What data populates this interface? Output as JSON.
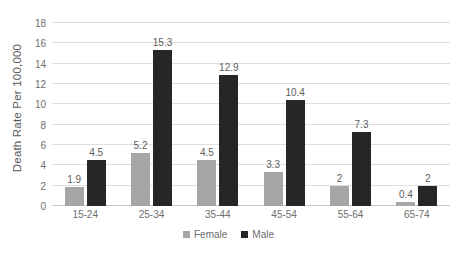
{
  "chart_data": {
    "type": "bar",
    "title": "",
    "xlabel": "",
    "ylabel": "Death Rate Per 100,000",
    "categories": [
      "15-24",
      "25-34",
      "35-44",
      "45-54",
      "55-64",
      "65-74"
    ],
    "series": [
      {
        "name": "Female",
        "color": "#a6a6a6",
        "values": [
          1.9,
          5.2,
          4.5,
          3.3,
          2,
          0.4
        ],
        "labels": [
          "1.9",
          "5.2",
          "4.5",
          "3.3",
          "2",
          "0.4"
        ]
      },
      {
        "name": "Male",
        "color": "#262626",
        "values": [
          4.5,
          15.3,
          12.9,
          10.4,
          7.3,
          2
        ],
        "labels": [
          "4.5",
          "15.3",
          "12.9",
          "10.4",
          "7.3",
          "2"
        ]
      }
    ],
    "ylim": [
      0,
      18
    ],
    "yticks": [
      0,
      2,
      4,
      6,
      8,
      10,
      12,
      14,
      16,
      18
    ],
    "ytick_labels": [
      "0",
      "2",
      "4",
      "6",
      "8",
      "10",
      "12",
      "14",
      "16",
      "18"
    ],
    "grid": true,
    "legend_position": "bottom"
  },
  "colors": {
    "female": "#a6a6a6",
    "male": "#262626",
    "gridline": "#dedede",
    "text": "#6e6e6e",
    "background": "#ffffff"
  }
}
